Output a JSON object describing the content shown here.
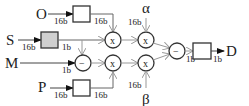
{
  "diagram": {
    "inputs": {
      "O": "O",
      "S": "S",
      "M": "M",
      "P": "P"
    },
    "params": {
      "alpha": "α",
      "beta": "β"
    },
    "output": "D",
    "operators": {
      "mult": "x",
      "sub": "−"
    },
    "widths": {
      "o_in": "16b",
      "o_out": "16b",
      "s_in": "16b",
      "s_out": "1b",
      "m_in": "1b",
      "p_in": "16b",
      "p_out": "16b",
      "alpha_in": "16b",
      "beta_in": "16b",
      "sub_out": "1b",
      "d_out": "1b"
    },
    "colors": {
      "line": "#444444",
      "shaded_box": "#cfcfcf",
      "arrow": "#999999"
    }
  }
}
